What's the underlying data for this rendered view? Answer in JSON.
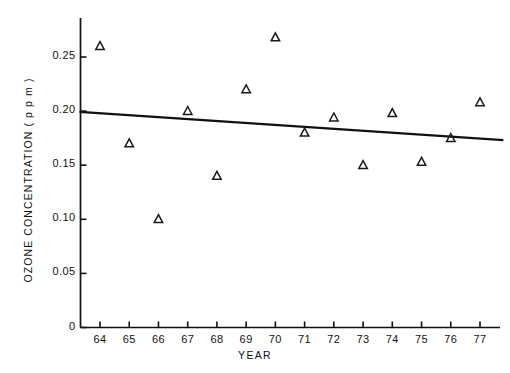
{
  "chart_data": {
    "type": "scatter",
    "title": "",
    "xlabel": "YEAR",
    "ylabel": "OZONE CONCENTRATION  ( p p m )",
    "xlim": [
      63.3,
      78.0
    ],
    "ylim": [
      0,
      0.283
    ],
    "grid": false,
    "legend": null,
    "x_tick_labels": [
      "64",
      "65",
      "66",
      "67",
      "68",
      "69",
      "70",
      "71",
      "72",
      "73",
      "74",
      "75",
      "76",
      "77"
    ],
    "x_tick_values": [
      64,
      65,
      66,
      67,
      68,
      69,
      70,
      71,
      72,
      73,
      74,
      75,
      76,
      77
    ],
    "y_tick_labels": [
      "0",
      "0.05",
      "0.10",
      "0.15",
      "0.20",
      "0.25"
    ],
    "y_tick_values": [
      0,
      0.05,
      0.1,
      0.15,
      0.2,
      0.25
    ],
    "marker": "triangle-up",
    "marker_color": "#1a1a1a",
    "x": [
      64,
      65,
      66,
      67,
      68,
      69,
      70,
      71,
      72,
      73,
      74,
      75,
      76,
      77
    ],
    "values": [
      0.26,
      0.17,
      0.1,
      0.2,
      0.14,
      0.22,
      0.268,
      0.18,
      0.194,
      0.15,
      0.198,
      0.153,
      0.175,
      0.208
    ],
    "series": [
      {
        "name": "Ozone concentration",
        "type": "scatter",
        "x": [
          64,
          65,
          66,
          67,
          68,
          69,
          70,
          71,
          72,
          73,
          74,
          75,
          76,
          77
        ],
        "values": [
          0.26,
          0.17,
          0.1,
          0.2,
          0.14,
          0.22,
          0.268,
          0.18,
          0.194,
          0.15,
          0.198,
          0.153,
          0.175,
          0.208
        ]
      },
      {
        "name": "Trend line",
        "type": "line",
        "x": [
          63.3,
          77.8
        ],
        "values": [
          0.1993,
          0.1732
        ],
        "color": "#111111"
      }
    ],
    "annotations": []
  },
  "axis": {
    "line_color": "#111111"
  }
}
